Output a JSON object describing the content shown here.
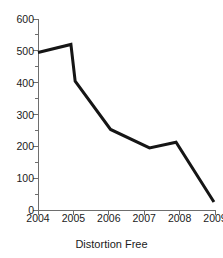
{
  "chart_data": {
    "type": "line",
    "title": "",
    "xlabel": "Distortion Free",
    "ylabel": "",
    "categories": [
      "2004",
      "2005",
      "2006",
      "2007",
      "2008",
      "2009"
    ],
    "x": [
      2004,
      2005,
      2006,
      2007,
      2008,
      2009
    ],
    "values": [
      495,
      520,
      253,
      195,
      213,
      25
    ],
    "series": [
      {
        "name": "Distortion Free",
        "values": [
          495,
          520,
          253,
          195,
          213,
          25
        ]
      }
    ],
    "vertices": [
      {
        "x": 2004.0,
        "y": 495
      },
      {
        "x": 2004.93,
        "y": 520
      },
      {
        "x": 2005.05,
        "y": 405
      },
      {
        "x": 2006.05,
        "y": 253
      },
      {
        "x": 2007.15,
        "y": 195
      },
      {
        "x": 2007.9,
        "y": 213
      },
      {
        "x": 2008.97,
        "y": 25
      }
    ],
    "ylim": [
      0,
      600
    ],
    "xlim": [
      2004,
      2009
    ],
    "ytick_labels": [
      "0",
      "100",
      "200",
      "300",
      "400",
      "500",
      "600"
    ],
    "yticks": [
      0,
      100,
      200,
      300,
      400,
      500,
      600
    ],
    "yminor_ticks": [
      50,
      150,
      250,
      350,
      450,
      550
    ],
    "xtick_labels": [
      "2004",
      "2005",
      "2006",
      "2007",
      "2008",
      "2009"
    ],
    "grid": false,
    "legend": "none",
    "line_color": "#151515",
    "axis_color": "#6e6e6e",
    "text_color": "#1a1a1a",
    "background": "#ffffff",
    "line_width": 3
  }
}
